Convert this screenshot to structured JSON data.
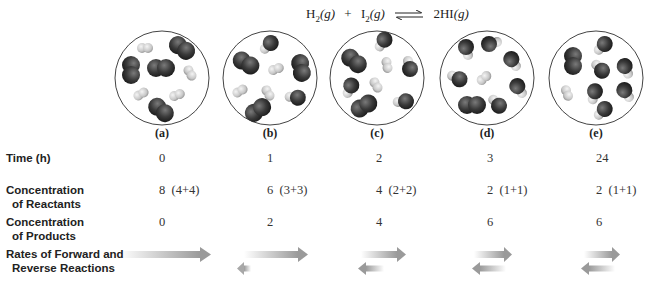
{
  "equation": {
    "reactant1": "H",
    "reactant1_sub": "2",
    "reactant1_state": "(g)",
    "plus": "+",
    "reactant2": "I",
    "reactant2_sub": "2",
    "reactant2_state": "(g)",
    "product": "2HI",
    "product_state": "(g)",
    "arrow": "equilibrium-arrows"
  },
  "panels": [
    {
      "label": "(a)",
      "time": "0",
      "reactants": "8  (4+4)",
      "products": "0",
      "forward_rate": "large",
      "reverse_rate": "none"
    },
    {
      "label": "(b)",
      "time": "1",
      "reactants": "6  (3+3)",
      "products": "2",
      "forward_rate": "medium-large",
      "reverse_rate": "tiny"
    },
    {
      "label": "(c)",
      "time": "2",
      "reactants": "4  (2+2)",
      "products": "4",
      "forward_rate": "medium",
      "reverse_rate": "small"
    },
    {
      "label": "(d)",
      "time": "3",
      "reactants": "2  (1+1)",
      "products": "6",
      "forward_rate": "equal",
      "reverse_rate": "equal"
    },
    {
      "label": "(e)",
      "time": "24",
      "reactants": "2  (1+1)",
      "products": "6",
      "forward_rate": "equal",
      "reverse_rate": "equal"
    }
  ],
  "rows": {
    "time": "Time (h)",
    "reactants_l1": "Concentration",
    "reactants_l2": "of Reactants",
    "products_l1": "Concentration",
    "products_l2": "of Products",
    "rates_l1": "Rates of Forward and",
    "rates_l2": "Reverse Reactions"
  },
  "colors": {
    "h2": "#cfcfcf",
    "i2": "#3a3a3a",
    "circle": "#444444",
    "arrow": "#9a9a9a"
  }
}
